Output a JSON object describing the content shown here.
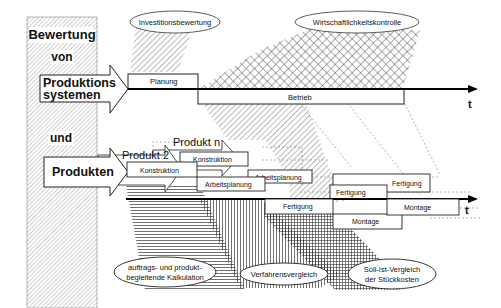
{
  "diagram": {
    "title_column": {
      "line1": "Bewertung",
      "line2": "von",
      "line3": "und"
    },
    "arrows": {
      "systems": {
        "line1": "Produktions",
        "line2": "systemen"
      },
      "products": {
        "label": "Produkten"
      },
      "product2": {
        "label": "Produkt 2"
      },
      "productn": {
        "label": "Produkt n"
      }
    },
    "top_timeline": {
      "phases": [
        {
          "label": "Planung"
        },
        {
          "label": "Betrieb"
        }
      ],
      "axis_label": "t"
    },
    "bottom_timeline": {
      "phases": {
        "p1_konstruktion": "Konstruktion",
        "pn_konstruktion": "Konstruktion",
        "p1_arbeitsplanung": "Arbeitsplanung",
        "pn_arbeitsplanung": "Arbeitsplanung",
        "p1_fertigung": "Fertigung",
        "p2_fertigung": "Fertigung",
        "pn_fertigung": "Fertigung",
        "p1_montage": "Montage",
        "p2_montage": "Montage"
      },
      "axis_label": "t"
    },
    "evaluations": {
      "investment": "Investitionsbewertung",
      "profitability": "Wirtschaftlichkeitskontrolle",
      "costing": {
        "line1": "auftrags- und produkt-",
        "line2": "begleitende Kalkulation"
      },
      "process": "Verfahrensvergleich",
      "target_actual": {
        "line1": "Soll-Ist-Vergleich",
        "line2": "der Stückkosten"
      }
    }
  }
}
